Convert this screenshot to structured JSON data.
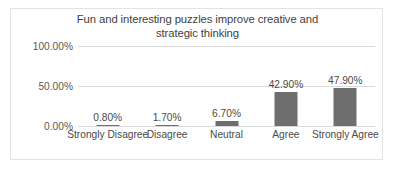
{
  "chart_data": {
    "type": "bar",
    "title": "Fun and interesting puzzles improve creative and strategic thinking",
    "title_line1": "Fun and interesting puzzles improve creative and",
    "title_line2": "strategic thinking",
    "xlabel": "",
    "ylabel": "",
    "categories": [
      "Strongly Disagree",
      "Disagree",
      "Neutral",
      "Agree",
      "Strongly Agree"
    ],
    "values": [
      0.8,
      1.7,
      6.7,
      42.9,
      47.9
    ],
    "data_labels": [
      "0.80%",
      "1.70%",
      "6.70%",
      "42.90%",
      "47.90%"
    ],
    "ylim": [
      0,
      100
    ],
    "yticks": [
      0,
      50,
      100
    ],
    "ytick_labels": [
      "0.00%",
      "50.00%",
      "100.00%"
    ],
    "grid": true,
    "legend": false,
    "series_color": "#6e6e6e",
    "gridline_color": "#d9d9d9",
    "border_color": "#e3e3e3",
    "background_color": "#ffffff"
  }
}
